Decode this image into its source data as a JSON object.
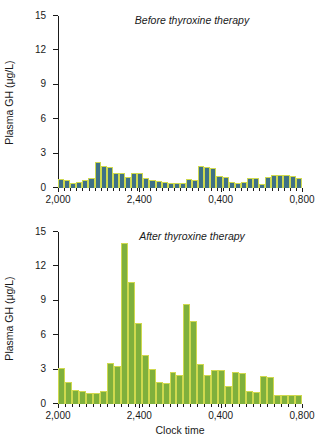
{
  "figure": {
    "xlabel": "Clock time",
    "ylabel": "Plasma GH (μg/L)"
  },
  "chart_data": [
    {
      "type": "bar",
      "title": "Before thyroxine therapy",
      "xlabel": "",
      "ylabel": "Plasma GH (μg/L)",
      "ylim": [
        0,
        15
      ],
      "yticks": [
        0,
        3,
        6,
        9,
        12,
        15
      ],
      "ytick_labels": [
        "0",
        "3",
        "6",
        "9",
        "12",
        "15"
      ],
      "xtick_labels": [
        "2,000",
        "2,400",
        "0,400",
        "0,800"
      ],
      "xtick_positions": [
        0,
        0.3333,
        0.6667,
        1.0
      ],
      "grid": false,
      "legend": null,
      "bar_color": "#3f7186",
      "bar_edge_color": "#cfd94f",
      "values": [
        0.75,
        0.7,
        0.45,
        0.55,
        0.7,
        0.9,
        2.25,
        1.9,
        1.8,
        1.35,
        1.3,
        1.0,
        1.35,
        1.3,
        0.85,
        0.7,
        0.6,
        0.55,
        0.45,
        0.45,
        0.45,
        0.75,
        0.7,
        1.95,
        1.85,
        1.75,
        1.05,
        0.95,
        0.5,
        0.45,
        0.5,
        0.9,
        0.85,
        0.35,
        0.95,
        1.15,
        1.15,
        1.1,
        1.05,
        0.85
      ]
    },
    {
      "type": "bar",
      "title": "After thyroxine therapy",
      "xlabel": "Clock time",
      "ylabel": "Plasma GH (μg/L)",
      "ylim": [
        0,
        15
      ],
      "yticks": [
        0,
        3,
        6,
        9,
        12,
        15
      ],
      "ytick_labels": [
        "0",
        "3",
        "6",
        "9",
        "12",
        "15"
      ],
      "xtick_labels": [
        "2,000",
        "2,400",
        "0,400",
        "0,800"
      ],
      "xtick_positions": [
        0,
        0.3333,
        0.6667,
        1.0
      ],
      "grid": false,
      "legend": null,
      "bar_color": "#7fb03c",
      "bar_edge_color": "#cfd94f",
      "values": [
        3.15,
        1.95,
        1.2,
        1.15,
        0.95,
        1.0,
        1.15,
        3.6,
        3.3,
        14.05,
        10.6,
        7.05,
        4.25,
        3.05,
        1.9,
        1.8,
        2.8,
        2.55,
        8.75,
        7.2,
        3.5,
        2.55,
        2.95,
        2.95,
        1.55,
        2.75,
        2.7,
        1.1,
        1.05,
        2.4,
        2.35,
        0.8,
        0.8,
        0.8,
        0.8
      ]
    }
  ]
}
